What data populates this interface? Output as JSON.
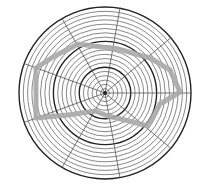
{
  "chart_data": {
    "type": "radar",
    "title": "",
    "grid": {
      "center": [
        105,
        93
      ],
      "outer_radius": 86,
      "ring_count": 20,
      "major_rings": [
        6,
        12,
        20
      ],
      "spoke_count": 9,
      "spoke_angles_deg": [
        0,
        40,
        80,
        120,
        160,
        200,
        240,
        280,
        320
      ]
    },
    "series": [
      {
        "name": "profile",
        "color": "#a8a8a8",
        "stroke_width": 5,
        "points_px": [
          [
            180,
            92
          ],
          [
            170,
            70
          ],
          [
            150,
            58
          ],
          [
            118,
            49
          ],
          [
            78,
            44
          ],
          [
            53,
            57
          ],
          [
            36,
            68
          ],
          [
            36,
            118
          ],
          [
            68,
            115
          ],
          [
            95,
            111
          ],
          [
            108,
            116
          ],
          [
            125,
            120
          ],
          [
            148,
            126
          ],
          [
            160,
            104
          ]
        ]
      }
    ],
    "colors": {
      "grid_minor": "#555555",
      "grid_major": "#222222",
      "background": "#ffffff"
    }
  }
}
